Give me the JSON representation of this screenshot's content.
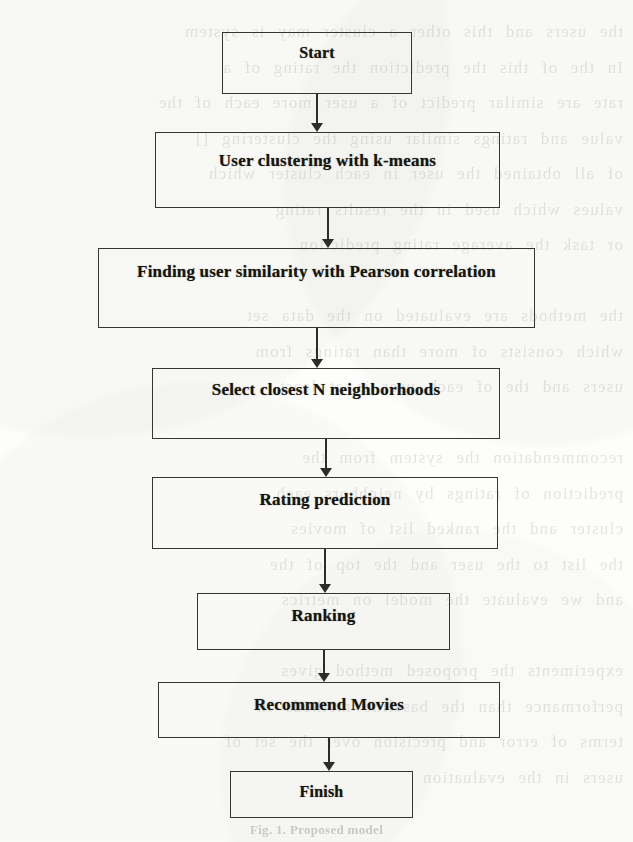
{
  "document": {
    "type": "scanned-paper-figure",
    "caption": "Fig. 1. Proposed model"
  },
  "diagram": {
    "title": "Proposed model",
    "orientation": "top-to-bottom",
    "node_shape": "rectangle",
    "border_color": "#37352f",
    "text_color": "#16150f",
    "background_color": "#fdfdfb",
    "nodes": [
      {
        "id": "start",
        "label": "Start",
        "kind": "terminator"
      },
      {
        "id": "cluster",
        "label": "User clustering  with  k-means",
        "kind": "process"
      },
      {
        "id": "similarity",
        "label": "Finding user similarity with Pearson correlation",
        "kind": "process"
      },
      {
        "id": "neighbors",
        "label": "Select closest N neighborhoods",
        "kind": "process"
      },
      {
        "id": "rating",
        "label": "Rating prediction",
        "kind": "process"
      },
      {
        "id": "ranking",
        "label": "Ranking",
        "kind": "process"
      },
      {
        "id": "recommend",
        "label": "Recommend Movies",
        "kind": "process"
      },
      {
        "id": "finish",
        "label": "Finish",
        "kind": "terminator"
      }
    ],
    "edges": [
      {
        "from": "start",
        "to": "cluster",
        "arrow": "down"
      },
      {
        "from": "cluster",
        "to": "similarity",
        "arrow": "down"
      },
      {
        "from": "similarity",
        "to": "neighbors",
        "arrow": "down"
      },
      {
        "from": "neighbors",
        "to": "rating",
        "arrow": "down"
      },
      {
        "from": "rating",
        "to": "ranking",
        "arrow": "down"
      },
      {
        "from": "ranking",
        "to": "recommend",
        "arrow": "down"
      },
      {
        "from": "recommend",
        "to": "finish",
        "arrow": "down"
      }
    ]
  },
  "scan_artifact": {
    "description": "faint mirrored bleed-through text from the reverse side of the scanned page",
    "lines": [
      "the users and this other a cluster may is system",
      "In the of this the prediction the rating of a",
      "rate are similar predict of a user more each of the",
      "value and ratings similar using the clustering []",
      "of all obtained the user in each cluster which",
      "values which used in the results rating",
      "or task the average rating prediction",
      "",
      "the methods are evaluated on the data set",
      "which consists of more than ratings from",
      "users and the of each user is at least",
      "",
      "recommendation the system from the",
      "prediction of ratings by neighbors each",
      "cluster and the ranked list of movies",
      "the list to the user and the top of the",
      "and we evaluate the model on metrics",
      "",
      "experiments the proposed method gives",
      "performance than the baseline methods in",
      "terms of error and precision over the set of",
      "users in the evaluation"
    ]
  }
}
